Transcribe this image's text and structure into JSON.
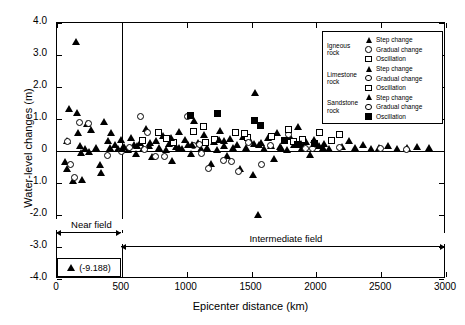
{
  "chart_data": {
    "type": "scatter",
    "title": "",
    "xlabel": "Epicenter distance (km)",
    "ylabel": "Water-level changes (m)",
    "xlim": [
      0,
      3000
    ],
    "ylim": [
      -4.0,
      4.0
    ],
    "xticks": [
      0,
      500,
      1000,
      1500,
      2000,
      2500,
      3000
    ],
    "xtick_labels": [
      "0",
      "500",
      "1000",
      "1500",
      "2000",
      "2500",
      "3000"
    ],
    "yticks": [
      -4.0,
      -3.0,
      -2.0,
      -1.0,
      0,
      1.0,
      2.0,
      3.0,
      4.0
    ],
    "ytick_labels": [
      "-4.0",
      "-3.0",
      "-2.0",
      "-1.0",
      "0",
      "1.0",
      "2.0",
      "3.0",
      "4.0"
    ],
    "grid": false,
    "legend_position": "top-right",
    "reference_lines": [
      {
        "name": "zero-line",
        "orientation": "horizontal",
        "value": 0
      },
      {
        "name": "near-field-boundary",
        "orientation": "vertical",
        "value": 500
      }
    ],
    "annotations": [
      {
        "name": "near-field",
        "label": "Near field",
        "x_range": [
          0,
          500
        ]
      },
      {
        "name": "intermediate-field",
        "label": "Intermediate field",
        "x_range": [
          500,
          3000
        ]
      },
      {
        "name": "off-scale-outlier",
        "label": "(-9.188)",
        "marker": "filled-triangle"
      }
    ],
    "series": [
      {
        "name": "Igneous rock - Step change",
        "marker": "filled-triangle",
        "points": [
          [
            60,
            -0.35
          ],
          [
            75,
            0.3
          ],
          [
            78,
            -0.55
          ],
          [
            95,
            1.3
          ],
          [
            120,
            -0.95
          ],
          [
            150,
            3.4
          ],
          [
            155,
            1.2
          ],
          [
            160,
            0.55
          ],
          [
            175,
            0.15
          ],
          [
            185,
            -0.05
          ],
          [
            195,
            -0.9
          ],
          [
            215,
            0.05
          ],
          [
            235,
            0.85
          ],
          [
            250,
            -0.02
          ],
          [
            265,
            0.65
          ],
          [
            300,
            0.1
          ],
          [
            330,
            -0.45
          ],
          [
            340,
            -0.7
          ],
          [
            360,
            0.9
          ],
          [
            390,
            0.3
          ],
          [
            405,
            0.08
          ],
          [
            420,
            0.55
          ],
          [
            450,
            0.2
          ],
          [
            470,
            0.05
          ],
          [
            495,
            0.35
          ],
          [
            520,
            0.12
          ],
          [
            545,
            0.02
          ],
          [
            570,
            0.42
          ],
          [
            590,
            0.18
          ],
          [
            610,
            -0.1
          ],
          [
            640,
            0.25
          ],
          [
            665,
            0.05
          ],
          [
            690,
            0.7
          ],
          [
            710,
            0.15
          ],
          [
            735,
            -0.2
          ],
          [
            760,
            0.3
          ],
          [
            790,
            0.08
          ],
          [
            815,
            0.48
          ],
          [
            840,
            0.02
          ],
          [
            865,
            0.22
          ],
          [
            890,
            -0.3
          ],
          [
            915,
            0.12
          ],
          [
            940,
            0.6
          ],
          [
            965,
            0.05
          ],
          [
            990,
            0.35
          ],
          [
            1010,
            0.18
          ],
          [
            1035,
            -0.08
          ],
          [
            1060,
            0.95
          ],
          [
            1085,
            0.25
          ],
          [
            1110,
            0.05
          ],
          [
            1135,
            0.5
          ],
          [
            1160,
            0.1
          ],
          [
            1185,
            -0.4
          ],
          [
            1210,
            0.28
          ],
          [
            1235,
            0.02
          ],
          [
            1260,
            0.62
          ],
          [
            1285,
            0.15
          ],
          [
            1310,
            -0.15
          ],
          [
            1335,
            0.38
          ],
          [
            1360,
            0.08
          ],
          [
            1385,
            0.2
          ],
          [
            1410,
            -0.55
          ],
          [
            1435,
            0.45
          ],
          [
            1460,
            0.1
          ],
          [
            1485,
            0.3
          ],
          [
            1510,
            -0.75
          ],
          [
            1530,
            1.8
          ],
          [
            1550,
            -2.0
          ],
          [
            1575,
            0.25
          ],
          [
            1600,
            0.05
          ],
          [
            1625,
            0.4
          ],
          [
            1650,
            0.15
          ],
          [
            1675,
            -0.25
          ],
          [
            1700,
            0.55
          ],
          [
            1725,
            0.08
          ],
          [
            1750,
            0.32
          ],
          [
            1775,
            0.02
          ],
          [
            1800,
            0.45
          ],
          [
            1830,
            0.18
          ],
          [
            1860,
            0.75
          ],
          [
            1890,
            0.1
          ],
          [
            1920,
            0.28
          ],
          [
            1950,
            -0.12
          ],
          [
            1985,
            0.35
          ],
          [
            2020,
            0.15
          ],
          [
            2060,
            0.22
          ],
          [
            2100,
            0.05
          ],
          [
            2150,
            0.95
          ],
          [
            2200,
            0.12
          ],
          [
            2250,
            0.3
          ],
          [
            2300,
            0.08
          ],
          [
            2360,
            0.18
          ],
          [
            2420,
            0.05
          ],
          [
            2480,
            0.1
          ],
          [
            2550,
            0.15
          ],
          [
            2620,
            0.05
          ],
          [
            2700,
            0.08
          ],
          [
            2780,
            0.12
          ],
          [
            2870,
            0.1
          ]
        ]
      },
      {
        "name": "Igneous rock - Gradual change",
        "marker": "open-circle",
        "points": [
          [
            85,
            0.28
          ],
          [
            105,
            -0.45
          ],
          [
            140,
            -0.85
          ],
          [
            180,
            0.88
          ],
          [
            245,
            0.85
          ],
          [
            390,
            -0.15
          ],
          [
            505,
            -0.02
          ],
          [
            645,
            1.05
          ],
          [
            700,
            0.55
          ],
          [
            760,
            -0.2
          ],
          [
            1010,
            1.05
          ],
          [
            1060,
            0.15
          ],
          [
            1170,
            -0.55
          ],
          [
            1290,
            -0.3
          ],
          [
            1400,
            -0.65
          ],
          [
            1580,
            -0.45
          ],
          [
            1790,
            0.5
          ],
          [
            1975,
            0.05
          ],
          [
            2180,
            0.1
          ],
          [
            2500,
            0.05
          ],
          [
            2700,
            0.02
          ]
        ]
      },
      {
        "name": "Igneous rock - Oscillation",
        "marker": "open-square",
        "points": [
          [
            660,
            0.3
          ],
          [
            790,
            0.55
          ],
          [
            900,
            0.25
          ],
          [
            1055,
            0.6
          ],
          [
            1130,
            0.75
          ],
          [
            1215,
            0.35
          ],
          [
            1380,
            0.55
          ],
          [
            1470,
            0.4
          ],
          [
            1660,
            0.45
          ],
          [
            1790,
            0.65
          ],
          [
            1900,
            0.35
          ],
          [
            2030,
            0.55
          ],
          [
            2120,
            0.3
          ],
          [
            2180,
            0.5
          ]
        ]
      },
      {
        "name": "Limestone rock - Step change",
        "marker": "filled-triangle",
        "points": [
          [
            505,
            0.05
          ],
          [
            720,
            0.25
          ],
          [
            880,
            0.42
          ],
          [
            1040,
            0.18
          ],
          [
            1290,
            0.3
          ],
          [
            1520,
            0.22
          ],
          [
            1720,
            0.12
          ],
          [
            2050,
            0.08
          ]
        ]
      },
      {
        "name": "Limestone rock - Gradual change",
        "marker": "open-circle",
        "points": [
          [
            560,
            0.1
          ],
          [
            830,
            -0.18
          ],
          [
            1100,
            0.2
          ],
          [
            1350,
            -0.35
          ],
          [
            1650,
            0.15
          ]
        ]
      },
      {
        "name": "Limestone rock - Oscillation",
        "marker": "open-square",
        "points": [
          [
            845,
            0.38
          ],
          [
            1150,
            0.25
          ],
          [
            1450,
            0.52
          ],
          [
            1830,
            0.28
          ]
        ]
      },
      {
        "name": "Sandstone rock - Step change",
        "marker": "filled-triangle",
        "points": [
          [
            620,
            0.15
          ],
          [
            940,
            0.08
          ],
          [
            1250,
            0.35
          ],
          [
            1560,
            0.18
          ],
          [
            1880,
            0.22
          ]
        ]
      },
      {
        "name": "Sandstone rock - Gradual change",
        "marker": "open-circle",
        "points": [
          [
            680,
            0.02
          ],
          [
            1120,
            -0.1
          ],
          [
            1480,
            0.25
          ],
          [
            1920,
            0.05
          ]
        ]
      },
      {
        "name": "Sandstone rock - Oscillation",
        "marker": "filled-square",
        "points": [
          [
            1035,
            1.1
          ],
          [
            1240,
            1.15
          ],
          [
            1530,
            0.95
          ],
          [
            1570,
            0.78
          ],
          [
            1760,
            0.3
          ],
          [
            1855,
            0.18
          ],
          [
            1990,
            0.22
          ]
        ]
      }
    ]
  },
  "legend": {
    "groups": [
      {
        "group_label": "Igneous rock",
        "entries": [
          {
            "marker": "filled-triangle",
            "label": "Step change"
          },
          {
            "marker": "open-circle",
            "label": "Gradual change"
          },
          {
            "marker": "open-square",
            "label": "Oscillation"
          }
        ]
      },
      {
        "group_label": "Limestone rock",
        "entries": [
          {
            "marker": "filled-triangle",
            "label": "Step change"
          },
          {
            "marker": "open-circle",
            "label": "Gradual change"
          },
          {
            "marker": "open-square",
            "label": "Oscillation"
          }
        ]
      },
      {
        "group_label": "Sandstone rock",
        "entries": [
          {
            "marker": "filled-triangle",
            "label": "Step change"
          },
          {
            "marker": "open-circle",
            "label": "Gradual change"
          },
          {
            "marker": "filled-square",
            "label": "Oscillation"
          }
        ]
      }
    ]
  },
  "fields": {
    "near": "Near field",
    "intermediate": "Intermediate field"
  },
  "outlier": {
    "value_label": "(-9.188)"
  }
}
